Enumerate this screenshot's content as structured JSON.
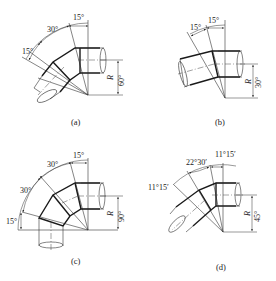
{
  "figure": {
    "panels": [
      {
        "id": "a",
        "caption": "(a)",
        "total_angle": "60°",
        "radius_label": "R",
        "segment_angles": [
          "15°",
          "30°",
          "15°"
        ]
      },
      {
        "id": "b",
        "caption": "(b)",
        "total_angle": "30°",
        "radius_label": "R",
        "segment_angles": [
          "15°",
          "15°"
        ]
      },
      {
        "id": "c",
        "caption": "(c)",
        "total_angle": "90°",
        "radius_label": "R",
        "segment_angles": [
          "15°",
          "30°",
          "30°",
          "15°"
        ]
      },
      {
        "id": "d",
        "caption": "(d)",
        "total_angle": "45°",
        "radius_label": "R",
        "segment_angles": [
          "11°15′",
          "22°30′",
          "11°15′"
        ]
      }
    ],
    "colors": {
      "line": "#1a1a1a",
      "background": "#ffffff"
    }
  }
}
